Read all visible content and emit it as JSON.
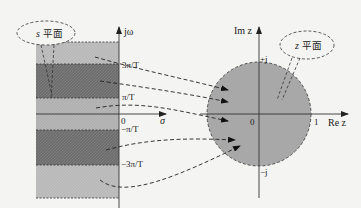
{
  "s_plane": {
    "bubble_label_var": "s",
    "bubble_label_text": "平面",
    "vertical_axis_label": "jω",
    "horizontal_axis_label": "σ",
    "origin_label": "0",
    "tick_labels": [
      "3π/T",
      "π/T",
      "−π/T",
      "−3π/T"
    ],
    "band_colors": {
      "light": "#b8b8b8",
      "dark": "#707070",
      "center": "#aeaeae"
    }
  },
  "z_plane": {
    "bubble_label_var": "z",
    "bubble_label_text": "平面",
    "vertical_axis_label": "Im z",
    "horizontal_axis_label": "Re z",
    "origin_label": "0",
    "unit_label": "1",
    "plus_j_label": "+j",
    "minus_j_label": "−j",
    "disk_color": "#a6a6a6"
  },
  "mapping_arrows": 6
}
